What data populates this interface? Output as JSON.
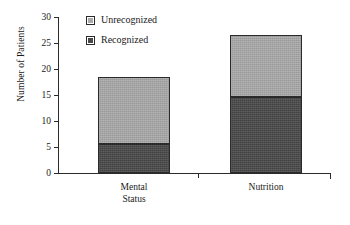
{
  "chart_data": {
    "type": "bar",
    "subtype": "stacked-bar",
    "title": "",
    "xlabel": "",
    "ylabel": "Number of Patients",
    "ylim": [
      0,
      30
    ],
    "yticks": [
      0,
      5,
      10,
      15,
      20,
      25,
      30
    ],
    "ytick_labels": [
      "0",
      "5",
      "10",
      "15",
      "20",
      "25",
      "30"
    ],
    "grid": false,
    "legend_position": "top-center",
    "categories": [
      "Mental Status",
      "Nutrition"
    ],
    "category_label_lines": [
      [
        "Mental",
        "Status"
      ],
      [
        "Nutrition"
      ]
    ],
    "series": [
      {
        "name": "Recognized",
        "color": "#484848",
        "values": [
          5.6,
          14.6
        ]
      },
      {
        "name": "Unrecognized",
        "color": "#a9a9a9",
        "values": [
          12.8,
          12.0
        ]
      }
    ],
    "stack_totals": [
      18.4,
      26.6
    ],
    "colors": {
      "unrecognized": "#a9a9a9",
      "recognized": "#484848",
      "axis": "#2b2b2b",
      "bar_border": "#2a2a2a",
      "background": "#ffffff"
    }
  },
  "legend": {
    "items": [
      {
        "label": "Unrecognized",
        "swatch": "legend-swatch-unrecognized"
      },
      {
        "label": "Recognized",
        "swatch": "legend-swatch-recognized"
      }
    ]
  },
  "axes": {
    "y_title": "Number of Patients",
    "y_ticks": [
      "30",
      "25",
      "20",
      "15",
      "10",
      "5",
      "0"
    ],
    "x_categories": [
      {
        "line1": "Mental",
        "line2": "Status"
      },
      {
        "line1": "Nutrition",
        "line2": ""
      }
    ]
  }
}
